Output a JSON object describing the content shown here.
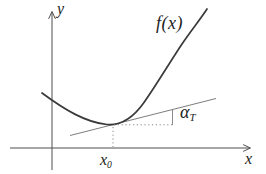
{
  "figure": {
    "colors": {
      "bg": "#ffffff",
      "ink": "#3a3a3a",
      "axis": "#4f4f4f",
      "tangent": "#6e6e6e",
      "guide": "#7a7a7a",
      "label": "#222222"
    },
    "labels": {
      "y_axis": "y",
      "x_axis": "x",
      "function": "f(x)",
      "x0_base": "x",
      "x0_sub": "0",
      "alpha_base": "α",
      "alpha_sub": "T"
    }
  }
}
